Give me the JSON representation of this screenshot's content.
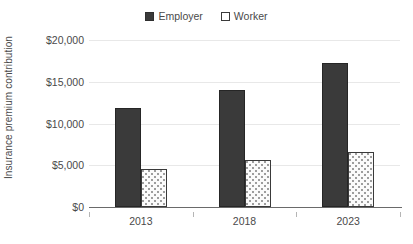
{
  "chart_data": {
    "type": "bar",
    "title": "",
    "subtitle": "",
    "xlabel": "",
    "ylabel": "Insurance premium contribution",
    "categories": [
      "2013",
      "2018",
      "2023"
    ],
    "series": [
      {
        "name": "Employer",
        "values": [
          11800,
          14000,
          17300
        ],
        "color": "#3a3a3a",
        "fill": "solid"
      },
      {
        "name": "Worker",
        "values": [
          4600,
          5600,
          6600
        ],
        "color": "#ffffff",
        "fill": "dotted"
      }
    ],
    "ylim": [
      0,
      20000
    ],
    "ytick_values": [
      20000,
      15000,
      10000,
      5000,
      0
    ],
    "ytick_labels": [
      "$20,000",
      "$15,000",
      "$10,000",
      "$5,000",
      "$0"
    ],
    "grid": true,
    "grid_axis": "y",
    "legend_position": "top-center"
  },
  "legend": {
    "entries": [
      {
        "label": "Employer",
        "swatch": "filled-square-icon"
      },
      {
        "label": "Worker",
        "swatch": "outlined-square-icon"
      }
    ]
  },
  "axes": {
    "y_title": "Insurance premium contribution",
    "y_ticks": [
      "$20,000",
      "$15,000",
      "$10,000",
      "$5,000",
      "$0"
    ],
    "x_ticks": [
      "2013",
      "2018",
      "2023"
    ]
  }
}
